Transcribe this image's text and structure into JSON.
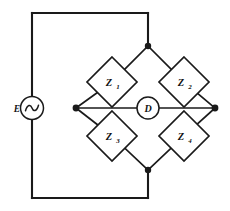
{
  "diagram": {
    "type": "electrical-schematic",
    "line_color": "#1a1a1a",
    "background_color": "#ffffff",
    "source": {
      "label": "E",
      "symbol": "ac-source-sine",
      "position": "left-branch"
    },
    "detector": {
      "label": "D",
      "symbol": "detector-circle",
      "position": "bridge-center"
    },
    "arms": [
      {
        "id": "z1",
        "label": "Z",
        "subscript": "1",
        "position": "upper-left"
      },
      {
        "id": "z2",
        "label": "Z",
        "subscript": "2",
        "position": "upper-right"
      },
      {
        "id": "z3",
        "label": "Z",
        "subscript": "3",
        "position": "lower-left"
      },
      {
        "id": "z4",
        "label": "Z",
        "subscript": "4",
        "position": "lower-right"
      }
    ],
    "nodes": [
      {
        "id": "node-top",
        "x": 148,
        "y": 46
      },
      {
        "id": "node-left",
        "x": 76,
        "y": 108
      },
      {
        "id": "node-right",
        "x": 215,
        "y": 108
      },
      {
        "id": "node-bottom",
        "x": 148,
        "y": 170
      }
    ],
    "geometry": {
      "outer_rect": {
        "left": 32,
        "top": 13,
        "right": 148,
        "bottom": 198
      },
      "diamond_half_width": 25,
      "diamond_half_height": 25,
      "detector_radius": 11,
      "source_radius": 11.5,
      "node_dot_radius": 3.2
    }
  }
}
